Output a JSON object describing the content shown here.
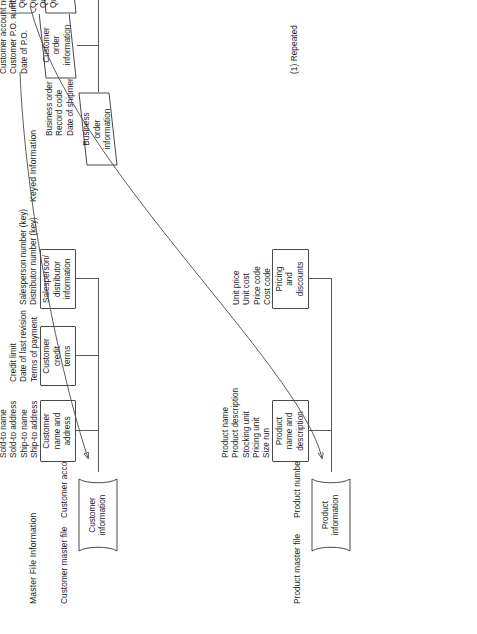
{
  "diagram": {
    "sections": {
      "master": {
        "title": "Master File Information",
        "files": [
          {
            "file_label": "Customer master file",
            "key_label": "Customer account number",
            "store_label": "Customer\ninformation",
            "groups": [
              {
                "box_label": "Customer\nname and\naddress",
                "fields": [
                  "Sold-to name",
                  "Sold-to address",
                  "Ship-to name",
                  "Ship-to address"
                ]
              },
              {
                "box_label": "Customer\ncredit\nterms",
                "fields": [
                  "Credit limit",
                  "Date of last revision",
                  "Terms of payment"
                ]
              },
              {
                "box_label": "Salesperson/\ndistributor\ninformation",
                "fields": [
                  "Salesperson number (key)",
                  "Distributor number (key)"
                ]
              }
            ]
          },
          {
            "file_label": "Product master file",
            "key_label": "Product number",
            "store_label": "Product\ninformation",
            "groups": [
              {
                "box_label": "Product\nname and\ndescription",
                "fields": [
                  "Product name",
                  "Product description",
                  "Stocking unit",
                  "Pricing unit",
                  "Size run"
                ]
              },
              {
                "box_label": "Pricing\nand\ndiscounts",
                "fields": [
                  "Unit price",
                  "Unit cost",
                  "Price code",
                  "Cost code"
                ]
              }
            ]
          }
        ]
      },
      "keyed": {
        "title": "Keyed Information",
        "root": {
          "box_label": "Business\norder\ninformation",
          "fields": [
            "Business order number",
            "Record code",
            "Date of shipment"
          ]
        },
        "groups": [
          {
            "box_label": "Customer\norder\ninformation",
            "bracket": false,
            "fields": [
              "Customer account number (key)",
              "Customer P.O. number",
              "Date of P.O."
            ]
          },
          {
            "box_label": "Packing\ninformation",
            "bracket": true,
            "fields": [
              "Product number (1) (key)",
              "Quantity ordered",
              "Quantity shipped",
              "Quantity back-ordered",
              "Quantity canceled"
            ]
          },
          {
            "box_label": "General\nledger\ninformation",
            "bracket": true,
            "fields": [
              "Freight charges",
              "Insurance charges",
              "General ledger code"
            ]
          }
        ],
        "footnote": "(1) Repeated"
      }
    },
    "colors": {
      "stroke": "#4a4a4a",
      "line": "#5a5a5a",
      "text": "#1c1c1c",
      "background": "#ffffff"
    }
  }
}
